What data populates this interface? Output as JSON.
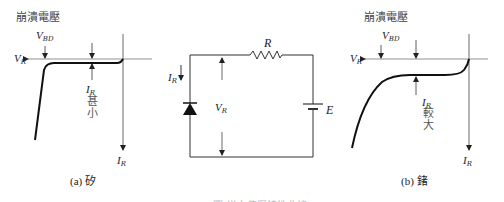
{
  "figure": {
    "panel_a": {
      "title": "崩潰電壓",
      "vbd_label": "V",
      "vbd_sub": "BD",
      "vr_label": "V",
      "vr_sub": "R",
      "ir_small_label": "I",
      "ir_small_sub": "R",
      "ir_note_1": "甚",
      "ir_note_2": "小",
      "ir_axis_label": "I",
      "ir_axis_sub": "R",
      "caption": "(a) 矽"
    },
    "circuit": {
      "resistor_label": "R",
      "current_label": "I",
      "current_sub": "R",
      "voltage_label": "V",
      "voltage_sub": "R",
      "source_label": "E"
    },
    "panel_b": {
      "title": "崩潰電壓",
      "vbd_label": "V",
      "vbd_sub": "BD",
      "vr_label": "V",
      "vr_sub": "R",
      "ir_large_label": "I",
      "ir_large_sub": "R",
      "ir_note_1": "較",
      "ir_note_2": "大",
      "ir_axis_label": "I",
      "ir_axis_sub": "R",
      "caption": "(b) 鍺"
    },
    "figure_caption": "圖 逆向偏壓特性曲線"
  }
}
